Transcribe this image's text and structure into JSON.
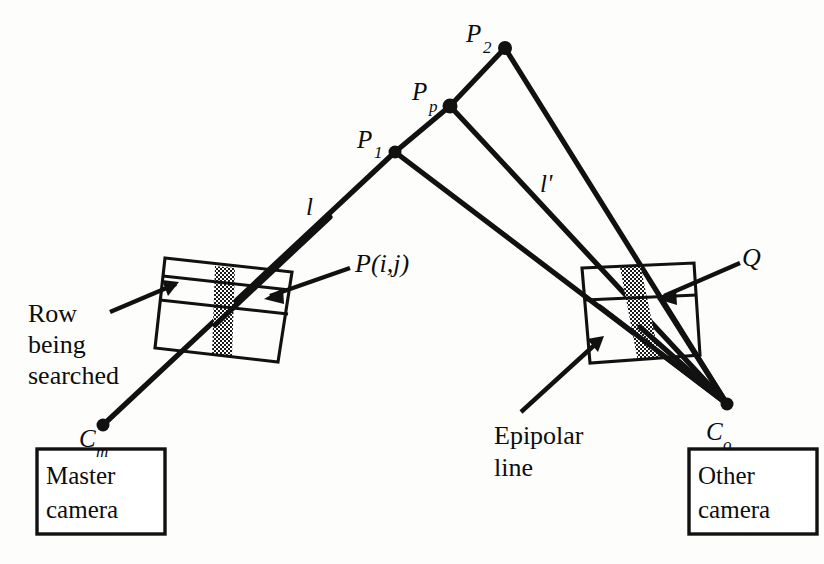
{
  "figure": {
    "background_color": "#fdfdfb",
    "ink_color": "#111111"
  },
  "points": {
    "p1": {
      "label": "P",
      "subscript": "1",
      "x": 395,
      "y": 152
    },
    "pp": {
      "label": "P",
      "subscript": "p",
      "x": 450,
      "y": 106
    },
    "p2": {
      "label": "P",
      "subscript": "2",
      "x": 505,
      "y": 48
    },
    "cm": {
      "label": "C",
      "subscript": "m",
      "x": 103,
      "y": 425
    },
    "co": {
      "label": "C",
      "subscript": "o",
      "x": 727,
      "y": 404
    }
  },
  "labels": {
    "p1_text": "P",
    "p1_sub": "1",
    "pp_text": "P",
    "pp_sub": "p",
    "p2_text": "P",
    "p2_sub": "2",
    "cm_text": "C",
    "cm_sub": "m",
    "co_text": "C",
    "co_sub": "o",
    "ray_l": "l",
    "ray_l_prime": "l'",
    "pixel_point": "P(i,j)",
    "match_point": "Q",
    "row_line1": "Row",
    "row_line2": "being",
    "row_line3": "searched",
    "epipolar_line1": "Epipolar",
    "epipolar_line2": "line",
    "master_line1": "Master",
    "master_line2": "camera",
    "other_line1": "Other",
    "other_line2": "camera"
  },
  "boxes": {
    "master_camera": {
      "x": 37,
      "y": 449,
      "width": 128,
      "height": 85
    },
    "other_camera": {
      "x": 689,
      "y": 449,
      "width": 128,
      "height": 85
    }
  },
  "image_planes": {
    "master_plane": {
      "name": "master-image-plane",
      "corners": [
        [
          165,
          258
        ],
        [
          292,
          272
        ],
        [
          278,
          362
        ],
        [
          155,
          348
        ]
      ],
      "row_band_top": [
        [
          163,
          275
        ],
        [
          290,
          289
        ]
      ],
      "row_band_bottom": [
        [
          160,
          299
        ],
        [
          287,
          313
        ]
      ],
      "column_band_label": "stippled-search-column"
    },
    "other_plane": {
      "name": "other-image-plane",
      "corners": [
        [
          582,
          268
        ],
        [
          694,
          263
        ],
        [
          700,
          355
        ],
        [
          590,
          363
        ]
      ],
      "band_label": "stippled-epipolar-band"
    }
  },
  "rays": {
    "l_from_cm": {
      "from": "C_m",
      "to": "P_1",
      "label": "l"
    },
    "l_prime": {
      "from": "C_o",
      "to": "P_2",
      "label": "l'"
    },
    "co_to_p1": {
      "from": "C_o",
      "to": "P_1"
    },
    "co_to_pp": {
      "from": "C_o",
      "to": "P_p"
    },
    "segment_p1_pp": {
      "from": "P_1",
      "to": "P_p"
    },
    "segment_pp_p2": {
      "from": "P_p",
      "to": "P_2"
    }
  },
  "annotations": {
    "row_being_searched": {
      "text_lines": [
        "Row",
        "being",
        "searched"
      ],
      "leader_from": [
        108,
        310
      ],
      "leader_to": [
        172,
        281
      ]
    },
    "epipolar_line": {
      "text_lines": [
        "Epipolar",
        "line"
      ],
      "leader_from": [
        520,
        411
      ],
      "leader_to": [
        598,
        338
      ]
    },
    "p_i_j": {
      "text": "P(i,j)",
      "leader_from": [
        352,
        268
      ],
      "leader_to": [
        262,
        300
      ]
    },
    "q_point": {
      "text": "Q",
      "leader_from": [
        742,
        262
      ],
      "leader_to": [
        658,
        298
      ]
    }
  }
}
